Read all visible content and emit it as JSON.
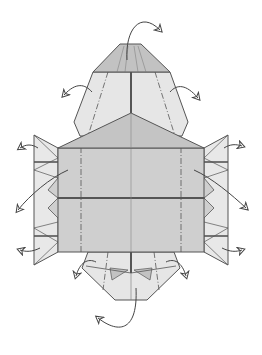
{
  "diagram": {
    "colors": {
      "background": "#ffffff",
      "paper_dark": "#b8b8b8",
      "paper_mid": "#cfcfcf",
      "paper_light": "#e6e6e6",
      "line": "#555555",
      "arrow": "#444444"
    },
    "parts": [
      "top-flap",
      "upper-body",
      "center-roof",
      "main-panel-upper",
      "main-panel-lower",
      "left-side-pleats",
      "right-side-pleats",
      "bottom-flap"
    ],
    "arrows": [
      "top-arrow",
      "upper-left-arrow",
      "upper-right-arrow",
      "left-top-arrow",
      "left-middle-arrow",
      "left-bottom-arrow",
      "right-top-arrow",
      "right-middle-arrow",
      "right-bottom-arrow",
      "bottom-left-arrow",
      "bottom-right-arrow",
      "bottom-arrow"
    ]
  }
}
